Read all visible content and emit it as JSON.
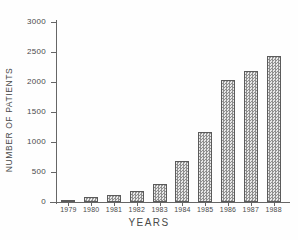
{
  "chart_data": {
    "type": "bar",
    "title": "",
    "xlabel": "YEARS",
    "ylabel": "NUMBER OF PATIENTS",
    "categories": [
      "1979",
      "1980",
      "1981",
      "1982",
      "1983",
      "1984",
      "1985",
      "1986",
      "1987",
      "1988"
    ],
    "values": [
      30,
      90,
      110,
      190,
      300,
      690,
      1160,
      2030,
      2190,
      2440
    ],
    "ylim": [
      0,
      3000
    ],
    "ytick_labels": [
      "0",
      "500",
      "1000",
      "1500",
      "2000",
      "2500",
      "3000"
    ],
    "ytick_values": [
      0,
      500,
      1000,
      1500,
      2000,
      2500,
      3000
    ],
    "grid": false,
    "legend": false,
    "bar_fill_color": "#d2d2d2",
    "bar_edge_color": "#5b5b5b",
    "axis_color": "#666666",
    "text_color": "#4a4a4a",
    "background_color": "#ffffff"
  }
}
